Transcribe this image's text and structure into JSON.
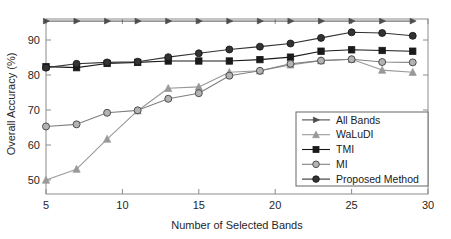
{
  "chart_data": {
    "type": "line",
    "title": "",
    "xlabel": "Number of Selected Bands",
    "ylabel": "Overall Accuracy (%)",
    "xlim": [
      5,
      30
    ],
    "ylim": [
      46,
      96
    ],
    "xticks": [
      5,
      10,
      15,
      20,
      25,
      30
    ],
    "yticks": [
      50,
      60,
      70,
      80,
      90
    ],
    "xtick_labels": [
      "5",
      "10",
      "15",
      "20",
      "25",
      "30"
    ],
    "ytick_labels": [
      "50",
      "60",
      "70",
      "80",
      "90"
    ],
    "grid": false,
    "legend_position": "lower right",
    "x": [
      5,
      7,
      9,
      11,
      13,
      15,
      17,
      19,
      21,
      23,
      25,
      27,
      29
    ],
    "series": [
      {
        "name": "All Bands",
        "marker": "triangle-right",
        "color": "#4d4d4d",
        "values": [
          95.4,
          95.4,
          95.4,
          95.4,
          95.4,
          95.4,
          95.4,
          95.4,
          95.4,
          95.4,
          95.4,
          95.4,
          95.4
        ]
      },
      {
        "name": "WaLuDI",
        "marker": "triangle-up",
        "color": "#999999",
        "values": [
          50.0,
          53.1,
          61.7,
          69.8,
          76.2,
          76.6,
          80.8,
          81.2,
          82.9,
          84.1,
          84.5,
          81.4,
          80.8
        ]
      },
      {
        "name": "TMI",
        "marker": "square",
        "color": "#1a1a1a",
        "values": [
          82.4,
          82.1,
          83.3,
          83.6,
          84.0,
          84.0,
          84.0,
          84.4,
          85.1,
          86.8,
          87.2,
          87.0,
          86.8
        ]
      },
      {
        "name": "MI",
        "marker": "circle-open",
        "color": "#808080",
        "values": [
          65.3,
          65.9,
          69.2,
          69.9,
          73.2,
          74.8,
          79.8,
          81.2,
          83.2,
          84.1,
          84.5,
          83.7,
          83.6
        ]
      },
      {
        "name": "Proposed Method",
        "marker": "circle-filled",
        "color": "#333333",
        "values": [
          82.1,
          83.2,
          83.6,
          83.8,
          85.1,
          86.2,
          87.3,
          88.1,
          89.0,
          90.6,
          92.2,
          92.0,
          91.2
        ]
      }
    ]
  },
  "axes": {
    "ylabel_text": "Overall Accuracy (%)",
    "xlabel_text": "Number of Selected Bands",
    "y_ticks": [
      {
        "label": "90",
        "value": 90
      },
      {
        "label": "80",
        "value": 80
      },
      {
        "label": "70",
        "value": 70
      },
      {
        "label": "60",
        "value": 60
      },
      {
        "label": "50",
        "value": 50
      }
    ],
    "x_ticks": [
      {
        "label": "5",
        "value": 5
      },
      {
        "label": "10",
        "value": 10
      },
      {
        "label": "15",
        "value": 15
      },
      {
        "label": "20",
        "value": 20
      },
      {
        "label": "25",
        "value": 25
      },
      {
        "label": "30",
        "value": 30
      }
    ]
  },
  "legend": {
    "entries": [
      {
        "label": "All Bands",
        "marker": "triangle-right-icon"
      },
      {
        "label": "WaLuDI",
        "marker": "triangle-up-icon"
      },
      {
        "label": "TMI",
        "marker": "square-icon"
      },
      {
        "label": "MI",
        "marker": "circle-open-icon"
      },
      {
        "label": "Proposed Method",
        "marker": "circle-filled-icon"
      }
    ]
  },
  "colors": {
    "axis": "#8c8c8c",
    "text": "#262626",
    "background": "#ffffff",
    "all_bands": "#4d4d4d",
    "waludi": "#999999",
    "tmi": "#1a1a1a",
    "mi": "#808080",
    "proposed": "#333333"
  }
}
